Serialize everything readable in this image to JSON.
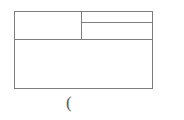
{
  "figure": {
    "kind": "table-wireframe",
    "line_color": "#7d7d7d",
    "background_color": "#ffffff",
    "text_color": "#555555"
  },
  "table": {
    "cells": {
      "top_left": "",
      "top_right_upper": "",
      "top_right_lower": "",
      "bottom_full": ""
    }
  },
  "caption": {
    "glyph": "(",
    "glyph_name": "left-parenthesis"
  }
}
